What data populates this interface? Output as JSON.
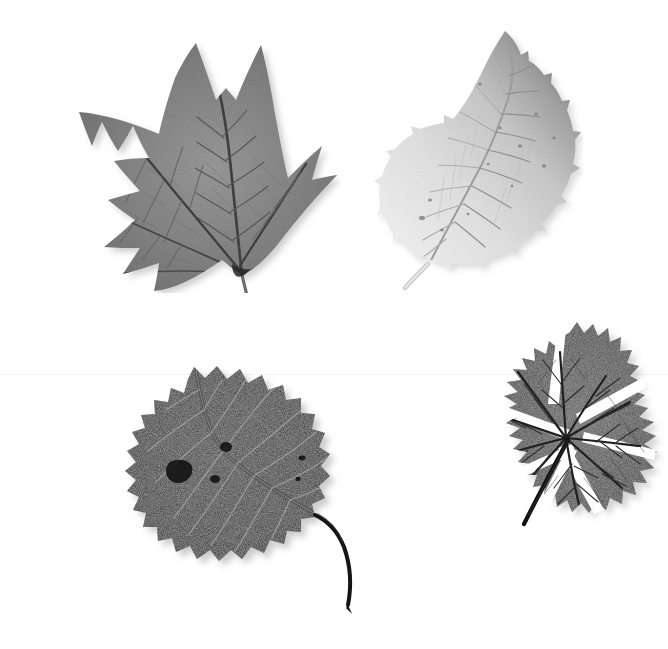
{
  "page": {
    "width": 668,
    "height": 649,
    "background_color": "#ffffff",
    "layout": "2x2 grid of isolated grayscale leaf specimens on white background",
    "seam": {
      "present": true,
      "orientation": "horizontal",
      "y": 374,
      "color": "#f4f4f4",
      "note": "faint scan seam between upper and lower halves"
    }
  },
  "specimens": [
    {
      "id": "leaf-tulip-poplar",
      "name": "tulip-poplar-leaf",
      "position": "top-left",
      "bbox": {
        "x": 45,
        "y": 40,
        "w": 278,
        "h": 238
      },
      "shape": "palmate, four to five lobed with broad notched apex",
      "margin": "entire, shallow sinuses",
      "tone": "medium gray",
      "body_color": "#868686",
      "body_color_dark": "#6a6a6a",
      "body_color_light": "#a2a2a2",
      "vein_color": "#474747",
      "petiole": {
        "color": "#5a5a5a",
        "direction": "down-right",
        "tip_x": 204,
        "tip_y": 271
      },
      "apex_x": 196,
      "apex_y": 43
    },
    {
      "id": "leaf-elm",
      "name": "elm-leaf",
      "position": "top-right",
      "bbox": {
        "x": 378,
        "y": 28,
        "w": 190,
        "h": 258
      },
      "shape": "ovate to elliptic, acuminate apex, asymmetric base",
      "margin": "doubly serrate",
      "tone": "very light gray with darker upper-right shading",
      "body_color": "#dedede",
      "body_color_dark": "#8e8e8e",
      "body_color_light": "#efefef",
      "vein_color": "#b0b0b0",
      "petiole": {
        "color": "#cccccc",
        "direction": "down-left",
        "tip_x": 388,
        "tip_y": 281
      },
      "apex_x": 505,
      "apex_y": 31
    },
    {
      "id": "leaf-aspen",
      "name": "aspen-cottonwood-leaf",
      "position": "bottom-left",
      "bbox": {
        "x": 85,
        "y": 372,
        "w": 250,
        "h": 230
      },
      "shape": "broadly ovate to nearly orbicular, short acuminate apex",
      "margin": "coarsely crenate-dentate",
      "tone": "very dark, near black with pale reticulate veins",
      "body_color": "#2b2b2b",
      "body_color_dark": "#1b1b1b",
      "body_color_light": "#3d3d3d",
      "vein_color": "#9a9a9a",
      "petiole": {
        "color": "#141414",
        "direction": "long curving down-right",
        "tip_x": 344,
        "tip_y": 606
      },
      "apex_x": 206,
      "apex_y": 375
    },
    {
      "id": "leaf-geranium",
      "name": "geranium-maple-leaf",
      "position": "bottom-right",
      "bbox": {
        "x": 428,
        "y": 328,
        "w": 232,
        "h": 218
      },
      "shape": "palmately five to seven lobed, deeply incised, rounded outline",
      "margin": "crenate to deeply toothed lobules",
      "tone": "dark gray",
      "body_color": "#4c4c4c",
      "body_color_dark": "#343434",
      "body_color_light": "#636363",
      "vein_color": "#232323",
      "petiole": {
        "color": "#101010",
        "direction": "straight down-left",
        "tip_x": 488,
        "tip_y": 536
      },
      "apex_x": 572,
      "apex_y": 330
    }
  ],
  "grid": {
    "rows": 2,
    "columns": 2,
    "cells": [
      {
        "row": 0,
        "col": 0,
        "specimen": "leaf-tulip-poplar"
      },
      {
        "row": 0,
        "col": 1,
        "specimen": "leaf-elm"
      },
      {
        "row": 1,
        "col": 0,
        "specimen": "leaf-aspen"
      },
      {
        "row": 1,
        "col": 1,
        "specimen": "leaf-geranium"
      }
    ]
  }
}
